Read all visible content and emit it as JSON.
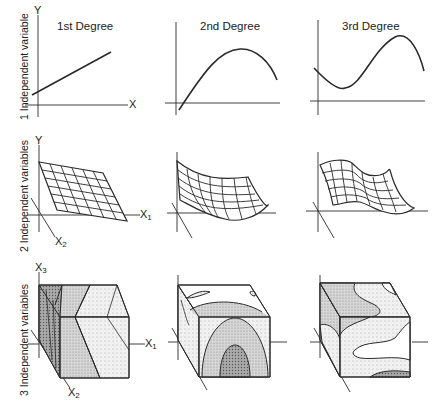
{
  "figure": {
    "columns": [
      {
        "label": "1st Degree"
      },
      {
        "label": "2nd Degree"
      },
      {
        "label": "3rd Degree"
      }
    ],
    "rows": [
      {
        "label": "1 Independent variable",
        "plot_type": "curve"
      },
      {
        "label": "2 Independent variables",
        "plot_type": "surface"
      },
      {
        "label": "3 Independent variables",
        "plot_type": "cube"
      }
    ],
    "axes": {
      "row1": {
        "y": "Y",
        "x": "X"
      },
      "row2": {
        "y": "Y",
        "x1": "X",
        "x1_sub": "1",
        "x2": "X",
        "x2_sub": "2"
      },
      "row3": {
        "x3": "X",
        "x3_sub": "3",
        "x1": "X",
        "x1_sub": "1",
        "x2": "X",
        "x2_sub": "2"
      }
    },
    "colors": {
      "line": "#2a2a2a",
      "shade_dark": "#8c8c8c",
      "shade_mid": "#b5b5b5",
      "shade_light": "#dcdcdc",
      "background": "#ffffff"
    }
  }
}
